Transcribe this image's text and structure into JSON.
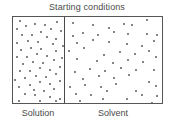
{
  "figure": {
    "title": "Starting conditions",
    "caption_left": "Solution",
    "caption_right": "Solvent",
    "colors": {
      "background": "#ffffff",
      "border": "#555555",
      "divider": "#4a4a4a",
      "particle": "#5c5c5c",
      "text": "#4a4a4a"
    }
  },
  "chart_data": {
    "type": "scatter",
    "title": "Starting conditions",
    "xlabel": "",
    "ylabel": "",
    "grid": false,
    "legend_position": "below",
    "panels": [
      {
        "name": "Solution",
        "label": "Solution",
        "particle_count": 56,
        "relative_width_pct": 35,
        "concentration": "high",
        "points": [
          [
            8,
            5
          ],
          [
            19,
            4
          ],
          [
            30,
            6
          ],
          [
            43,
            4
          ],
          [
            4,
            12
          ],
          [
            14,
            10
          ],
          [
            25,
            12
          ],
          [
            36,
            10
          ],
          [
            47,
            13
          ],
          [
            9,
            18
          ],
          [
            20,
            19
          ],
          [
            31,
            17
          ],
          [
            41,
            20
          ],
          [
            3,
            25
          ],
          [
            15,
            24
          ],
          [
            26,
            26
          ],
          [
            37,
            24
          ],
          [
            48,
            27
          ],
          [
            7,
            32
          ],
          [
            18,
            31
          ],
          [
            29,
            33
          ],
          [
            40,
            31
          ],
          [
            2,
            38
          ],
          [
            13,
            39
          ],
          [
            24,
            37
          ],
          [
            35,
            40
          ],
          [
            46,
            38
          ],
          [
            8,
            45
          ],
          [
            19,
            44
          ],
          [
            30,
            46
          ],
          [
            42,
            44
          ],
          [
            4,
            51
          ],
          [
            15,
            52
          ],
          [
            26,
            50
          ],
          [
            37,
            53
          ],
          [
            48,
            51
          ],
          [
            9,
            58
          ],
          [
            21,
            57
          ],
          [
            32,
            59
          ],
          [
            43,
            57
          ],
          [
            3,
            64
          ],
          [
            14,
            65
          ],
          [
            25,
            63
          ],
          [
            36,
            66
          ],
          [
            47,
            64
          ],
          [
            7,
            71
          ],
          [
            18,
            70
          ],
          [
            29,
            72
          ],
          [
            40,
            71
          ],
          [
            12,
            77
          ],
          [
            23,
            79
          ],
          [
            34,
            77
          ],
          [
            45,
            80
          ],
          [
            5,
            83
          ],
          [
            27,
            84
          ],
          [
            44,
            85
          ]
        ]
      },
      {
        "name": "Solvent",
        "label": "Solvent",
        "particle_count": 58,
        "relative_width_pct": 65,
        "concentration": "low",
        "points": [
          [
            8,
            7
          ],
          [
            24,
            5
          ],
          [
            41,
            9
          ],
          [
            57,
            6
          ],
          [
            66,
            8
          ],
          [
            82,
            4
          ],
          [
            4,
            16
          ],
          [
            15,
            14
          ],
          [
            31,
            17
          ],
          [
            48,
            15
          ],
          [
            63,
            18
          ],
          [
            78,
            14
          ],
          [
            89,
            16
          ],
          [
            10,
            25
          ],
          [
            27,
            23
          ],
          [
            44,
            26
          ],
          [
            58,
            24
          ],
          [
            74,
            27
          ],
          [
            87,
            23
          ],
          [
            3,
            34
          ],
          [
            19,
            32
          ],
          [
            35,
            35
          ],
          [
            52,
            33
          ],
          [
            68,
            36
          ],
          [
            83,
            34
          ],
          [
            12,
            43
          ],
          [
            28,
            41
          ],
          [
            45,
            44
          ],
          [
            61,
            42
          ],
          [
            77,
            45
          ],
          [
            91,
            41
          ],
          [
            6,
            52
          ],
          [
            22,
            50
          ],
          [
            38,
            53
          ],
          [
            55,
            51
          ],
          [
            71,
            54
          ],
          [
            85,
            50
          ],
          [
            15,
            60
          ],
          [
            32,
            58
          ],
          [
            48,
            61
          ],
          [
            64,
            59
          ],
          [
            80,
            62
          ],
          [
            2,
            68
          ],
          [
            18,
            67
          ],
          [
            35,
            70
          ],
          [
            51,
            68
          ],
          [
            67,
            71
          ],
          [
            88,
            67
          ],
          [
            9,
            76
          ],
          [
            25,
            78
          ],
          [
            42,
            75
          ],
          [
            58,
            79
          ],
          [
            74,
            76
          ],
          [
            90,
            78
          ],
          [
            14,
            84
          ],
          [
            38,
            83
          ],
          [
            62,
            85
          ],
          [
            84,
            84
          ]
        ]
      }
    ]
  }
}
